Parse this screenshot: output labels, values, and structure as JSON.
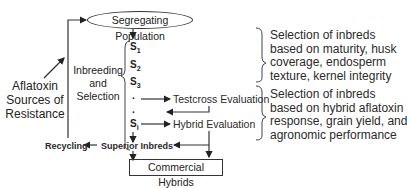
{
  "diagram": {
    "start_node": "Segregating Population",
    "process_label": [
      "Inbreeding",
      "and",
      "Selection"
    ],
    "generations": [
      {
        "base": "S",
        "sub": "1"
      },
      {
        "base": "S",
        "sub": "2"
      },
      {
        "base": "S",
        "sub": "3"
      },
      {
        "base": ".",
        "sub": ""
      },
      {
        "base": ".",
        "sub": ""
      },
      {
        "base": "S",
        "sub": "i"
      }
    ],
    "testcross": "Testcross Evaluation",
    "hybrid_eval": "Hybrid Evaluation",
    "superior": "Superior Inbreds",
    "recycling": "Recycling",
    "commercial": "Commercial Hybrids",
    "sources": [
      "Aflatoxin",
      "Sources of",
      "Resistance"
    ],
    "criteria_1": [
      "Selection of inbreds",
      "based on maturity, husk",
      "coverage, endosperm",
      "texture, kernel integrity"
    ],
    "criteria_2": [
      "Selection of inbreds",
      "based on hybrid aflatoxin",
      "response, grain yield, and",
      "agronomic performance"
    ]
  }
}
